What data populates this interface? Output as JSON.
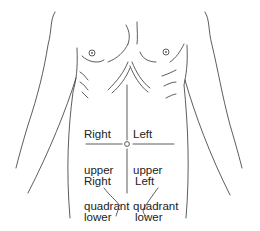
{
  "diagram": {
    "quadrants": {
      "right_upper": {
        "line1": "Right",
        "line2": "upper",
        "line3": "quadrant"
      },
      "left_upper": {
        "line1": "Left",
        "line2": "upper",
        "line3": "quadrant"
      },
      "right_lower": {
        "line1": "Right",
        "line2": "lower",
        "line3": "quadrant"
      },
      "left_lower": {
        "line1": "Left",
        "line2": "lower",
        "line3": "quadrant"
      }
    },
    "colors": {
      "line": "#333333",
      "text": "#222222",
      "background": "#ffffff"
    }
  }
}
